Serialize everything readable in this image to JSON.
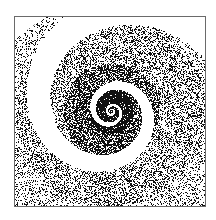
{
  "artwork": {
    "subject": "stippled logarithmic spiral",
    "frame": {
      "x": 14,
      "y": 16,
      "width": 192,
      "height": 191,
      "border_color": "#6a6a6a"
    },
    "center": {
      "x": 96,
      "y": 94
    },
    "colors": {
      "ink": "#111111",
      "paper": "#ffffff"
    }
  }
}
